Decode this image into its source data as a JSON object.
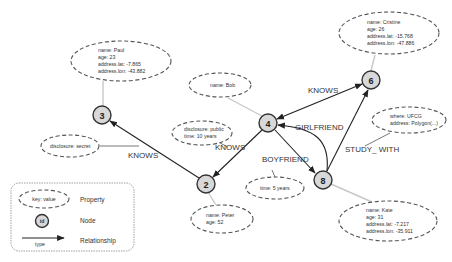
{
  "diagram": {
    "type": "property-graph",
    "colors": {
      "node_fill": "#d8d8d8",
      "node_stroke": "#333333",
      "edge": "#222222",
      "property_border": "#555555",
      "property_connector": "#c8c8c8"
    },
    "nodes": [
      {
        "id": "3",
        "properties": [
          "name: Paul",
          "age: 23",
          "address.lat: -7.865",
          "address.lon: -43.882"
        ]
      },
      {
        "id": "4",
        "properties": [
          "name: Bob"
        ]
      },
      {
        "id": "6",
        "properties": [
          "name: Cristine",
          "age: 26",
          "address.lat: -15.768",
          "address.lon: -47.886"
        ]
      },
      {
        "id": "2",
        "properties": [
          "name: Peter",
          "age: 52"
        ]
      },
      {
        "id": "8",
        "properties": [
          "name: Kate",
          "age: 31",
          "address.lat: -7.217",
          "address.lon: -35.911"
        ]
      }
    ],
    "edges": [
      {
        "from": "2",
        "to": "3",
        "type": "KNOWS",
        "properties": [
          "disclosure: secret"
        ]
      },
      {
        "from": "4",
        "to": "2",
        "type": "KNOWS",
        "properties": [
          "disclosure: public",
          "time: 10 years"
        ]
      },
      {
        "from": "6",
        "to": "4",
        "type": "KNOWS",
        "bidirectional": true,
        "properties": []
      },
      {
        "from": "4",
        "to": "8",
        "type": "BOYFRIEND",
        "properties": [
          "time: 5 years"
        ]
      },
      {
        "from": "8",
        "to": "4",
        "type": "GIRLFRIEND",
        "properties": []
      },
      {
        "from": "8",
        "to": "6",
        "type": "STUDY_WITH",
        "properties": [
          "where: UFCG",
          "address: Polygon(...)"
        ]
      }
    ]
  },
  "labels": {
    "node3": "3",
    "node4": "4",
    "node6": "6",
    "node2": "2",
    "node8": "8",
    "paul": [
      "name: Paul",
      "age: 23",
      "address.lat: -7.865",
      "address.lon: -43.882"
    ],
    "cristine": [
      "name: Cristine",
      "age: 26",
      "address.lat: -15.768",
      "address.lon: -47.886"
    ],
    "bob": [
      "name: Bob"
    ],
    "peter": [
      "name: Peter",
      "age: 52"
    ],
    "kate": [
      "name: Kate",
      "age: 31",
      "address.lat: -7.217",
      "address.lon: -35.911"
    ],
    "disclosure_public": [
      "disclosure: public",
      "time: 10 years"
    ],
    "disclosure_secret": [
      "disclosure: secret"
    ],
    "time_5_years": [
      "time: 5 years"
    ],
    "ufcg": [
      "where: UFCG",
      "address: Polygon(...)"
    ],
    "edge_knows_2_3": "KNOWS",
    "edge_knows_4_2": "KNOWS",
    "edge_knows_6_4": "KNOWS",
    "edge_girlfriend": "GIRLFRIEND",
    "edge_boyfriend": "BOYFRIEND",
    "edge_study_with": "STUDY_ WITH"
  },
  "legend": {
    "property_sample": "key: value",
    "property_label": "Property",
    "node_sample": "id",
    "node_label": "Node",
    "relationship_sample": "type",
    "relationship_label": "Relationship"
  }
}
